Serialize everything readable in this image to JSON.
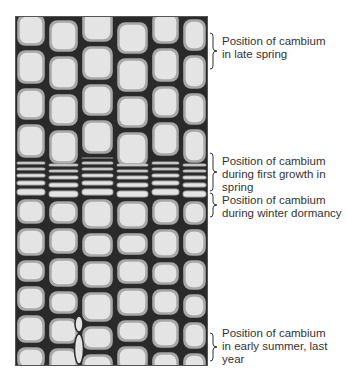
{
  "figure": {
    "colors": {
      "cell_fill": "#d9d9d9",
      "cell_inner": "#e4e4e4",
      "cell_wall": "#1e1e1e",
      "label_text": "#333333",
      "bracket": "#333333"
    }
  },
  "labels": [
    {
      "id": "late-spring",
      "text": "Position of cambium\nin late spring",
      "top": 35,
      "bracket_top": 32,
      "bracket_height": 38
    },
    {
      "id": "first-growth",
      "text": "Position of cambium\nduring first growth in\nspring",
      "top": 155,
      "bracket_top": 152,
      "bracket_height": 40
    },
    {
      "id": "winter-dormancy",
      "text": "Position of cambium\nduring winter dormancy",
      "top": 194,
      "bracket_top": 192,
      "bracket_height": 26
    },
    {
      "id": "early-summer",
      "text": "Position of cambium\nin early summer, last\nyear",
      "top": 327,
      "bracket_top": 332,
      "bracket_height": 30
    }
  ]
}
